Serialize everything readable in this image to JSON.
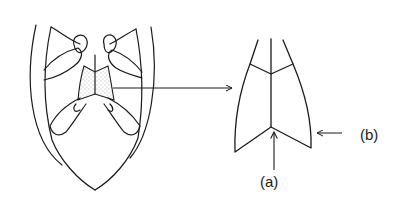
{
  "figure": {
    "left_drawing": "insect ventral view with stippled sternite region",
    "right_drawing": "enlarged sternite plate",
    "labels": {
      "a": "(a)",
      "b": "(b)"
    },
    "line_color": "#1a1a1a",
    "stipple_color": "#555555"
  }
}
